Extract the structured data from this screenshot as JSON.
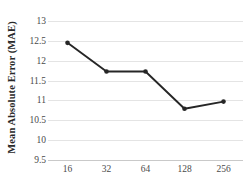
{
  "chart_data": {
    "type": "line",
    "title": "",
    "xlabel": "",
    "ylabel": "Mean Absolute Error (MAE)",
    "categories": [
      "16",
      "32",
      "64",
      "128",
      "256"
    ],
    "x": [
      16,
      32,
      64,
      128,
      256
    ],
    "values": [
      12.45,
      11.73,
      11.73,
      10.79,
      10.97
    ],
    "series": [
      {
        "name": "Mean Absolute Error (MAE)",
        "values": [
          12.45,
          11.73,
          11.73,
          10.79,
          10.97
        ]
      }
    ],
    "ylim": [
      9.5,
      13
    ],
    "yticks": [
      13,
      12.5,
      12,
      11.5,
      11,
      10.5,
      10,
      9.5
    ],
    "ytick_labels": [
      "13",
      "12.5",
      "12",
      "11.5",
      "11",
      "10.5",
      "10",
      "9.5"
    ],
    "xtick_labels": [
      "16",
      "32",
      "64",
      "128",
      "256"
    ],
    "grid": true,
    "legend": false,
    "legend_position": "none",
    "line_color": "#262626",
    "marker_color": "#262626",
    "grid_color": "#e4e4e4",
    "axis_color": "#c9c9c9",
    "text_color": "#4a4a4a",
    "background": "#ffffff",
    "annotations": []
  },
  "axes": {
    "y_title": "Mean Absolute Error (MAE)"
  }
}
